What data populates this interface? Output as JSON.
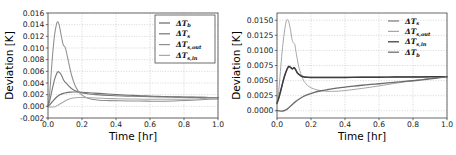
{
  "figure": {
    "background": "#ffffff",
    "panel_count": 2
  },
  "chart_data": [
    {
      "id": "left",
      "type": "line",
      "title": "",
      "xlabel": "Time [hr]",
      "ylabel": "Deviation [K]",
      "xlim": [
        0.0,
        1.0
      ],
      "ylim": [
        -0.002,
        0.016
      ],
      "xticks": [
        "0.0",
        "0.2",
        "0.4",
        "0.6",
        "0.8",
        "1.0"
      ],
      "xtick_values": [
        0.0,
        0.2,
        0.4,
        0.6,
        0.8,
        1.0
      ],
      "yticks": [
        "-0.002",
        "0.000",
        "0.002",
        "0.004",
        "0.006",
        "0.008",
        "0.010",
        "0.012",
        "0.014",
        "0.016"
      ],
      "ytick_values": [
        -0.002,
        0.0,
        0.002,
        0.004,
        0.006,
        0.008,
        0.01,
        0.012,
        0.014,
        0.016
      ],
      "grid": true,
      "legend_position": "upper right",
      "legend_frame": true,
      "series": [
        {
          "name": "ΔT_b",
          "label_base": "ΔT",
          "label_sub": "b",
          "color": "#6e6e6e",
          "width": 1.15,
          "x": [
            0.0,
            0.01,
            0.02,
            0.03,
            0.05,
            0.07,
            0.09,
            0.11,
            0.13,
            0.15,
            0.18,
            0.22,
            0.26,
            0.3,
            0.35,
            0.4,
            0.45,
            0.5,
            0.55,
            0.6,
            0.65,
            0.7,
            0.75,
            0.8,
            0.85,
            0.9,
            0.95,
            1.0
          ],
          "y": [
            0.0,
            0.00025,
            0.0006,
            0.00095,
            0.00155,
            0.00198,
            0.00222,
            0.00236,
            0.00243,
            0.00246,
            0.00245,
            0.00238,
            0.00229,
            0.00221,
            0.00211,
            0.00202,
            0.00194,
            0.00187,
            0.00181,
            0.00176,
            0.00171,
            0.00167,
            0.00163,
            0.0016,
            0.00157,
            0.00154,
            0.00152,
            0.0015
          ]
        },
        {
          "name": "ΔT_s",
          "label_base": "ΔT",
          "label_sub": "s",
          "color": "#7a7a7a",
          "width": 1.15,
          "x": [
            0.0,
            0.01,
            0.02,
            0.03,
            0.04,
            0.05,
            0.055,
            0.06,
            0.07,
            0.08,
            0.09,
            0.1,
            0.11,
            0.12,
            0.14,
            0.16,
            0.18,
            0.2,
            0.24,
            0.28,
            0.32,
            0.4,
            0.5,
            0.6,
            0.7,
            0.8,
            0.9,
            1.0
          ],
          "y": [
            0.0,
            0.00095,
            0.00225,
            0.0036,
            0.00475,
            0.00555,
            0.0058,
            0.00595,
            0.00575,
            0.0053,
            0.0046,
            0.0042,
            0.0039,
            0.00355,
            0.00302,
            0.00268,
            0.00246,
            0.00231,
            0.00212,
            0.00201,
            0.00193,
            0.00182,
            0.00172,
            0.00165,
            0.0016,
            0.00156,
            0.00153,
            0.0015
          ]
        },
        {
          "name": "ΔT_s,out",
          "label_base": "ΔT",
          "label_sub": "s,out",
          "color": "#8f8f8f",
          "width": 1.05,
          "x": [
            0.0,
            0.01,
            0.02,
            0.03,
            0.04,
            0.05,
            0.055,
            0.06,
            0.065,
            0.07,
            0.08,
            0.09,
            0.1,
            0.11,
            0.12,
            0.14,
            0.16,
            0.18,
            0.2,
            0.24,
            0.3,
            0.36,
            0.42,
            0.5,
            0.58,
            0.66,
            0.74,
            0.82,
            0.9,
            1.0
          ],
          "y": [
            0.0,
            0.00225,
            0.0062,
            0.0098,
            0.0125,
            0.0141,
            0.01445,
            0.01442,
            0.01405,
            0.01338,
            0.0118,
            0.0105,
            0.0102,
            0.0091,
            0.0077,
            0.0052,
            0.00352,
            0.00252,
            0.00192,
            0.00135,
            0.00106,
            0.00098,
            0.00094,
            0.00091,
            0.00089,
            0.00088,
            0.00091,
            0.00102,
            0.00114,
            0.00128
          ]
        },
        {
          "name": "ΔT_s,in",
          "label_base": "ΔT",
          "label_sub": "s,in",
          "color": "#a8a8a8",
          "width": 1.05,
          "x": [
            0.0,
            0.02,
            0.04,
            0.06,
            0.08,
            0.1,
            0.12,
            0.14,
            0.16,
            0.18,
            0.2,
            0.24,
            0.28,
            0.34,
            0.4,
            0.46,
            0.52,
            0.6,
            0.68,
            0.76,
            0.84,
            0.9,
            0.95,
            1.0
          ],
          "y": [
            -8e-05,
            -0.00012,
            -5e-05,
            0.00022,
            0.00058,
            0.00092,
            0.0012,
            0.00138,
            0.00148,
            0.00152,
            0.00152,
            0.00148,
            0.00143,
            0.00136,
            0.00131,
            0.00127,
            0.00124,
            0.00122,
            0.00121,
            0.00122,
            0.00126,
            0.00132,
            0.00138,
            0.00144
          ]
        }
      ]
    },
    {
      "id": "right",
      "type": "line",
      "title": "",
      "xlabel": "Time [hr]",
      "ylabel": "Deviation [K]",
      "xlim": [
        0.0,
        1.0
      ],
      "ylim": [
        -0.0012,
        0.0162
      ],
      "xticks": [
        "0.0",
        "0.2",
        "0.4",
        "0.6",
        "0.8",
        "1.0"
      ],
      "xtick_values": [
        0.0,
        0.2,
        0.4,
        0.6,
        0.8,
        1.0
      ],
      "yticks": [
        "0.0000",
        "0.0025",
        "0.0050",
        "0.0075",
        "0.0100",
        "0.0125",
        "0.0150"
      ],
      "ytick_values": [
        0.0,
        0.0025,
        0.005,
        0.0075,
        0.01,
        0.0125,
        0.015
      ],
      "grid": true,
      "legend_position": "upper right",
      "legend_frame": false,
      "series": [
        {
          "name": "ΔT_s",
          "label_base": "ΔT",
          "label_sub": "s",
          "color": "#7d7d7d",
          "width": 1.3,
          "x": [
            0.0,
            0.01,
            0.02,
            0.03,
            0.04,
            0.05,
            0.06,
            0.065,
            0.07,
            0.08,
            0.09,
            0.1,
            0.11,
            0.12,
            0.14,
            0.16,
            0.18,
            0.2,
            0.24,
            0.3,
            0.4,
            0.5,
            0.6,
            0.7,
            0.8,
            0.9,
            1.0
          ],
          "y": [
            0.0013,
            0.0021,
            0.00315,
            0.00425,
            0.00535,
            0.00625,
            0.00695,
            0.00722,
            0.00738,
            0.00722,
            0.00695,
            0.00718,
            0.00682,
            0.00628,
            0.00582,
            0.00562,
            0.00555,
            0.00552,
            0.00552,
            0.00553,
            0.00554,
            0.00556,
            0.00558,
            0.0056,
            0.00562,
            0.00564,
            0.00566
          ]
        },
        {
          "name": "ΔT_s,out",
          "label_base": "ΔT",
          "label_sub": "s,out",
          "color": "#a6a6a6",
          "width": 1.0,
          "x": [
            0.0,
            0.01,
            0.02,
            0.03,
            0.04,
            0.05,
            0.055,
            0.06,
            0.065,
            0.07,
            0.08,
            0.09,
            0.1,
            0.105,
            0.11,
            0.12,
            0.13,
            0.15,
            0.17,
            0.19,
            0.22,
            0.26,
            0.3,
            0.36,
            0.44,
            0.52,
            0.6,
            0.68,
            0.76,
            0.84,
            0.92,
            1.0
          ],
          "y": [
            0.00115,
            0.0032,
            0.0065,
            0.00975,
            0.0123,
            0.01425,
            0.0149,
            0.01512,
            0.01505,
            0.01468,
            0.0133,
            0.01165,
            0.01115,
            0.01095,
            0.01005,
            0.00845,
            0.00705,
            0.00538,
            0.00448,
            0.00398,
            0.00358,
            0.00332,
            0.00322,
            0.00325,
            0.00348,
            0.00378,
            0.00412,
            0.00448,
            0.00482,
            0.00512,
            0.00542,
            0.00568
          ]
        },
        {
          "name": "ΔT_s,in",
          "label_base": "ΔT",
          "label_sub": "s,in",
          "color": "#3c3c3c",
          "width": 1.45,
          "x": [
            0.0,
            0.01,
            0.02,
            0.03,
            0.04,
            0.05,
            0.06,
            0.065,
            0.07,
            0.08,
            0.09,
            0.1,
            0.11,
            0.12,
            0.14,
            0.16,
            0.18,
            0.2,
            0.24,
            0.3,
            0.4,
            0.5,
            0.6,
            0.7,
            0.8,
            0.9,
            1.0
          ],
          "y": [
            0.00125,
            0.00205,
            0.0031,
            0.00422,
            0.00532,
            0.00622,
            0.00692,
            0.00718,
            0.00735,
            0.00718,
            0.00692,
            0.00712,
            0.00678,
            0.00625,
            0.0058,
            0.0056,
            0.00553,
            0.0055,
            0.0055,
            0.00551,
            0.00552,
            0.00554,
            0.00556,
            0.00558,
            0.0056,
            0.00562,
            0.00564
          ]
        },
        {
          "name": "ΔT_b",
          "label_base": "ΔT",
          "label_sub": "b",
          "color": "#6b6b6b",
          "width": 1.35,
          "x": [
            0.0,
            0.02,
            0.04,
            0.06,
            0.08,
            0.1,
            0.12,
            0.15,
            0.18,
            0.22,
            0.26,
            0.3,
            0.35,
            0.4,
            0.45,
            0.5,
            0.55,
            0.6,
            0.65,
            0.7,
            0.75,
            0.8,
            0.85,
            0.9,
            0.95,
            1.0
          ],
          "y": [
            5e-05,
            -5e-05,
            0.0,
            0.00028,
            0.00078,
            0.0013,
            0.00175,
            0.00228,
            0.00268,
            0.00305,
            0.00332,
            0.00352,
            0.00375,
            0.00392,
            0.00408,
            0.00422,
            0.00436,
            0.00448,
            0.00462,
            0.00474,
            0.00486,
            0.00498,
            0.00512,
            0.00528,
            0.00546,
            0.00566
          ]
        }
      ]
    }
  ]
}
